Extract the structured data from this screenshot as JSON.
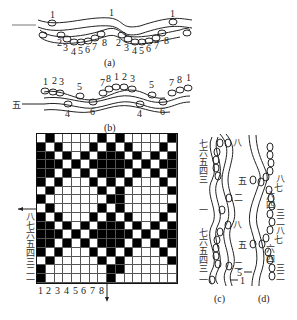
{
  "figure_a": {
    "caption": "(a)",
    "top_labels": [
      "1",
      "1",
      "1"
    ],
    "bottom_labels": [
      "2",
      "3",
      "4",
      "5",
      "6",
      "7",
      "8",
      "2",
      "3",
      "4",
      "5",
      "6",
      "7",
      "8"
    ]
  },
  "figure_b": {
    "caption": "(b)",
    "left_label": "五",
    "top_labels": [
      "1",
      "2",
      "3",
      "5",
      "7",
      "8",
      "1",
      "2",
      "3",
      "5",
      "7",
      "8",
      "1"
    ],
    "bottom_labels": [
      "4",
      "6",
      "4",
      "6"
    ]
  },
  "weave_grid": {
    "columns": 16,
    "rows": 17,
    "top_marker": "Z",
    "middle_marker": "甲",
    "left_labels": [
      "八",
      "七",
      "六",
      "五",
      "四",
      "三",
      "二",
      "一"
    ],
    "bottom_labels": [
      "1",
      "2",
      "3",
      "4",
      "5",
      "6",
      "7",
      "8"
    ],
    "pattern": [
      [
        0,
        1,
        0,
        0,
        0,
        0,
        0,
        1,
        0,
        1,
        0,
        0,
        0,
        0,
        0,
        1
      ],
      [
        1,
        0,
        1,
        0,
        0,
        0,
        1,
        0,
        1,
        0,
        1,
        0,
        0,
        0,
        1,
        0
      ],
      [
        1,
        1,
        0,
        1,
        0,
        1,
        0,
        1,
        1,
        1,
        0,
        1,
        0,
        1,
        0,
        1
      ],
      [
        1,
        1,
        1,
        0,
        1,
        0,
        1,
        1,
        1,
        1,
        1,
        0,
        1,
        0,
        1,
        1
      ],
      [
        1,
        1,
        0,
        1,
        0,
        1,
        0,
        1,
        1,
        1,
        0,
        1,
        0,
        1,
        0,
        1
      ],
      [
        1,
        0,
        1,
        0,
        0,
        0,
        1,
        0,
        1,
        0,
        1,
        0,
        0,
        0,
        1,
        0
      ],
      [
        0,
        1,
        0,
        0,
        0,
        0,
        0,
        1,
        0,
        1,
        0,
        0,
        0,
        0,
        0,
        1
      ],
      [
        1,
        0,
        0,
        0,
        0,
        0,
        0,
        0,
        1,
        1,
        0,
        0,
        0,
        0,
        0,
        0
      ],
      [
        0,
        1,
        0,
        0,
        0,
        0,
        0,
        1,
        0,
        1,
        0,
        0,
        0,
        0,
        0,
        1
      ],
      [
        1,
        0,
        1,
        0,
        0,
        0,
        1,
        0,
        1,
        0,
        1,
        0,
        0,
        0,
        1,
        0
      ],
      [
        1,
        1,
        0,
        1,
        0,
        1,
        0,
        1,
        1,
        1,
        0,
        1,
        0,
        1,
        0,
        1
      ],
      [
        1,
        1,
        1,
        0,
        1,
        0,
        1,
        1,
        1,
        1,
        1,
        0,
        1,
        0,
        1,
        1
      ],
      [
        1,
        1,
        0,
        1,
        0,
        1,
        0,
        1,
        1,
        1,
        0,
        1,
        0,
        1,
        0,
        1
      ],
      [
        1,
        0,
        1,
        0,
        0,
        0,
        1,
        0,
        1,
        0,
        1,
        0,
        0,
        0,
        1,
        0
      ],
      [
        0,
        1,
        0,
        0,
        0,
        0,
        0,
        1,
        0,
        1,
        0,
        0,
        0,
        0,
        0,
        1
      ],
      [
        1,
        0,
        0,
        0,
        0,
        0,
        0,
        0,
        1,
        1,
        0,
        0,
        0,
        0,
        0,
        0
      ],
      [
        1,
        0,
        0,
        0,
        0,
        0,
        0,
        0,
        1,
        0,
        0,
        0,
        0,
        0,
        0,
        0
      ]
    ]
  },
  "figure_c": {
    "caption": "(c)",
    "labels_left": [
      "七",
      "六",
      "五",
      "四",
      "三",
      "一",
      "七",
      "六",
      "五",
      "四",
      "三",
      "一"
    ],
    "labels_right": [
      "八",
      "二",
      "八",
      "二",
      "1"
    ]
  },
  "figure_d": {
    "caption": "(d)",
    "labels_left": [
      "五",
      "五",
      "5"
    ],
    "labels_right": [
      "八",
      "七",
      "六",
      "四",
      "三",
      "二",
      "八",
      "七",
      "六",
      "四",
      "三",
      "二"
    ]
  }
}
